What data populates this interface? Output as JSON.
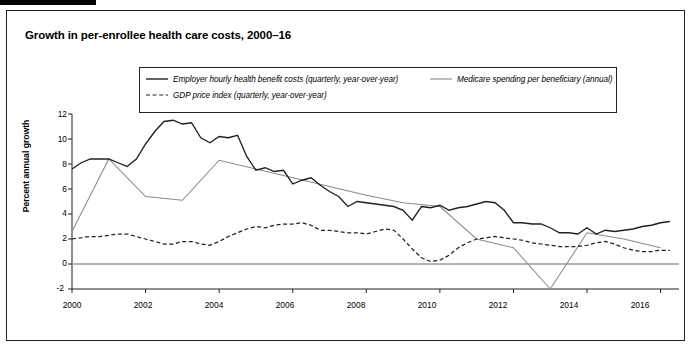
{
  "figure": {
    "title": "Growth in per-enrollee health care costs, 2000–16"
  },
  "legend": {
    "items": [
      {
        "key": "employer",
        "label": "Employer hourly health benefit costs (quarterly, year-over-year)",
        "style": "solid",
        "color": "#231f20"
      },
      {
        "key": "medicare",
        "label": "Medicare spending per beneficiary (annual)",
        "style": "solid",
        "color": "#8a8a8a"
      },
      {
        "key": "gdp",
        "label": "GDP price index (quarterly, year-over-year)",
        "style": "dashed",
        "color": "#231f20"
      }
    ]
  },
  "axes": {
    "ylabel": "Percent annual growth",
    "yticks": [
      "12",
      "10",
      "8",
      "6",
      "4",
      "2",
      "0",
      "-2"
    ],
    "xticks": [
      "2000",
      "2002",
      "2004",
      "2006",
      "2008",
      "2010",
      "2012",
      "2014",
      "2016"
    ]
  },
  "chart_data": {
    "type": "line",
    "title": "Growth in per-enrollee health care costs, 2000–16",
    "xlabel": "",
    "ylabel": "Percent annual growth",
    "xlim": [
      2000,
      2016.5
    ],
    "ylim": [
      -2,
      12
    ],
    "yticks": [
      -2,
      0,
      2,
      4,
      6,
      8,
      10,
      12
    ],
    "xticks": [
      2000,
      2002,
      2004,
      2006,
      2008,
      2010,
      2012,
      2014,
      2016
    ],
    "grid": false,
    "legend_position": "top-center",
    "zero_line": true,
    "series": [
      {
        "name": "Employer hourly health benefit costs (quarterly, year-over-year)",
        "style": "solid",
        "color": "#231f20",
        "points": [
          [
            2000.0,
            7.6
          ],
          [
            2000.25,
            8.1
          ],
          [
            2000.5,
            8.4
          ],
          [
            2000.75,
            8.4
          ],
          [
            2001.0,
            8.4
          ],
          [
            2001.25,
            8.1
          ],
          [
            2001.5,
            7.8
          ],
          [
            2001.75,
            8.4
          ],
          [
            2002.0,
            9.6
          ],
          [
            2002.25,
            10.6
          ],
          [
            2002.5,
            11.4
          ],
          [
            2002.75,
            11.5
          ],
          [
            2003.0,
            11.2
          ],
          [
            2003.25,
            11.3
          ],
          [
            2003.5,
            10.1
          ],
          [
            2003.75,
            9.7
          ],
          [
            2004.0,
            10.2
          ],
          [
            2004.25,
            10.1
          ],
          [
            2004.5,
            10.3
          ],
          [
            2004.75,
            8.6
          ],
          [
            2005.0,
            7.5
          ],
          [
            2005.25,
            7.7
          ],
          [
            2005.5,
            7.4
          ],
          [
            2005.75,
            7.5
          ],
          [
            2006.0,
            6.4
          ],
          [
            2006.25,
            6.7
          ],
          [
            2006.5,
            6.9
          ],
          [
            2006.75,
            6.3
          ],
          [
            2007.0,
            5.8
          ],
          [
            2007.25,
            5.4
          ],
          [
            2007.5,
            4.6
          ],
          [
            2007.75,
            5.0
          ],
          [
            2008.0,
            4.9
          ],
          [
            2008.25,
            4.8
          ],
          [
            2008.5,
            4.7
          ],
          [
            2008.75,
            4.6
          ],
          [
            2009.0,
            4.3
          ],
          [
            2009.25,
            3.5
          ],
          [
            2009.5,
            4.6
          ],
          [
            2009.75,
            4.5
          ],
          [
            2010.0,
            4.7
          ],
          [
            2010.25,
            4.3
          ],
          [
            2010.5,
            4.5
          ],
          [
            2010.75,
            4.6
          ],
          [
            2011.0,
            4.8
          ],
          [
            2011.25,
            5.0
          ],
          [
            2011.5,
            4.9
          ],
          [
            2011.75,
            4.3
          ],
          [
            2012.0,
            3.3
          ],
          [
            2012.25,
            3.3
          ],
          [
            2012.5,
            3.2
          ],
          [
            2012.75,
            3.2
          ],
          [
            2013.0,
            2.9
          ],
          [
            2013.25,
            2.5
          ],
          [
            2013.5,
            2.5
          ],
          [
            2013.75,
            2.4
          ],
          [
            2014.0,
            2.9
          ],
          [
            2014.25,
            2.4
          ],
          [
            2014.5,
            2.7
          ],
          [
            2014.75,
            2.6
          ],
          [
            2015.0,
            2.7
          ],
          [
            2015.25,
            2.8
          ],
          [
            2015.5,
            3.0
          ],
          [
            2015.75,
            3.1
          ],
          [
            2016.0,
            3.3
          ],
          [
            2016.25,
            3.4
          ]
        ]
      },
      {
        "name": "Medicare spending per beneficiary (annual)",
        "style": "solid",
        "color": "#8a8a8a",
        "points": [
          [
            2000,
            2.6
          ],
          [
            2001,
            8.4
          ],
          [
            2002,
            5.4
          ],
          [
            2003,
            5.1
          ],
          [
            2004,
            8.3
          ],
          [
            2005,
            7.6
          ],
          [
            2006,
            6.9
          ],
          [
            2007,
            6.2
          ],
          [
            2008,
            5.5
          ],
          [
            2009,
            4.9
          ],
          [
            2010,
            4.6
          ],
          [
            2011,
            2.0
          ],
          [
            2012,
            1.3
          ],
          [
            2013,
            -2.0
          ],
          [
            2014,
            2.5
          ],
          [
            2015,
            2.0
          ],
          [
            2016,
            1.3
          ]
        ]
      },
      {
        "name": "GDP price index (quarterly, year-over-year)",
        "style": "dashed",
        "color": "#231f20",
        "points": [
          [
            2000.0,
            2.0
          ],
          [
            2000.25,
            2.1
          ],
          [
            2000.5,
            2.2
          ],
          [
            2000.75,
            2.2
          ],
          [
            2001.0,
            2.3
          ],
          [
            2001.25,
            2.4
          ],
          [
            2001.5,
            2.4
          ],
          [
            2001.75,
            2.2
          ],
          [
            2002.0,
            2.0
          ],
          [
            2002.25,
            1.8
          ],
          [
            2002.5,
            1.6
          ],
          [
            2002.75,
            1.6
          ],
          [
            2003.0,
            1.8
          ],
          [
            2003.25,
            1.8
          ],
          [
            2003.5,
            1.6
          ],
          [
            2003.75,
            1.5
          ],
          [
            2004.0,
            1.8
          ],
          [
            2004.25,
            2.2
          ],
          [
            2004.5,
            2.5
          ],
          [
            2004.75,
            2.8
          ],
          [
            2005.0,
            3.0
          ],
          [
            2005.25,
            2.9
          ],
          [
            2005.5,
            3.1
          ],
          [
            2005.75,
            3.2
          ],
          [
            2006.0,
            3.2
          ],
          [
            2006.25,
            3.3
          ],
          [
            2006.5,
            3.1
          ],
          [
            2006.75,
            2.7
          ],
          [
            2007.0,
            2.7
          ],
          [
            2007.25,
            2.6
          ],
          [
            2007.5,
            2.5
          ],
          [
            2007.75,
            2.5
          ],
          [
            2008.0,
            2.4
          ],
          [
            2008.25,
            2.6
          ],
          [
            2008.5,
            2.8
          ],
          [
            2008.75,
            2.7
          ],
          [
            2009.0,
            2.0
          ],
          [
            2009.25,
            1.2
          ],
          [
            2009.5,
            0.5
          ],
          [
            2009.75,
            0.2
          ],
          [
            2010.0,
            0.3
          ],
          [
            2010.25,
            0.7
          ],
          [
            2010.5,
            1.3
          ],
          [
            2010.75,
            1.7
          ],
          [
            2011.0,
            2.0
          ],
          [
            2011.25,
            2.1
          ],
          [
            2011.5,
            2.2
          ],
          [
            2011.75,
            2.1
          ],
          [
            2012.0,
            2.0
          ],
          [
            2012.25,
            1.9
          ],
          [
            2012.5,
            1.7
          ],
          [
            2012.75,
            1.6
          ],
          [
            2013.0,
            1.5
          ],
          [
            2013.25,
            1.4
          ],
          [
            2013.5,
            1.4
          ],
          [
            2013.75,
            1.4
          ],
          [
            2014.0,
            1.5
          ],
          [
            2014.25,
            1.7
          ],
          [
            2014.5,
            1.8
          ],
          [
            2014.75,
            1.6
          ],
          [
            2015.0,
            1.3
          ],
          [
            2015.25,
            1.1
          ],
          [
            2015.5,
            1.0
          ],
          [
            2015.75,
            1.0
          ],
          [
            2016.0,
            1.1
          ],
          [
            2016.25,
            1.1
          ]
        ]
      }
    ]
  }
}
